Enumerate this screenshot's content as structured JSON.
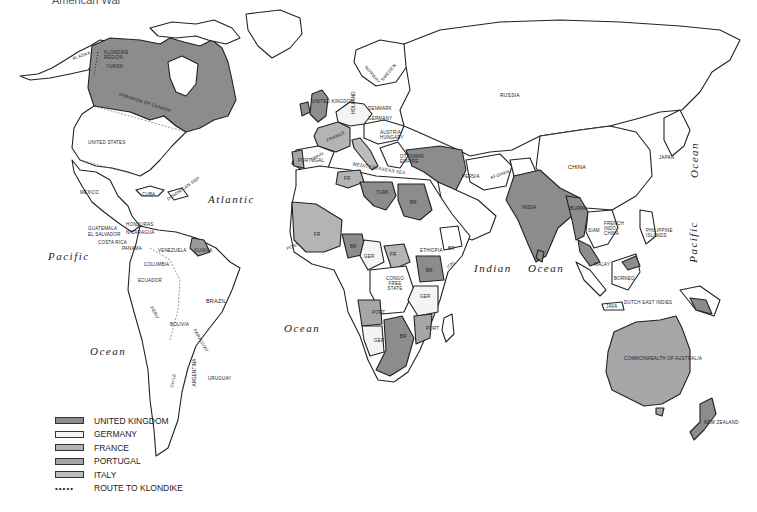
{
  "title": "American War",
  "colors": {
    "united_kingdom": "#8c8c8c",
    "germany": "#f4f4f4",
    "france": "#b4b4b4",
    "portugal": "#a6a6a6",
    "italy": "#bdbdbd",
    "land": "#ffffff",
    "outline": "#222222"
  },
  "legend": {
    "items": [
      {
        "label": "UNITED KINGDOM",
        "color": "#8c8c8c"
      },
      {
        "label": "GERMANY",
        "color": "#f4f4f4"
      },
      {
        "label": "FRANCE",
        "color": "#b4b4b4"
      },
      {
        "label": "PORTUGAL",
        "color": "#a6a6a6"
      },
      {
        "label": "ITALY",
        "color": "#bdbdbd"
      }
    ],
    "route": {
      "symbol": "•••••",
      "label": "ROUTE TO KLONDIKE"
    }
  },
  "oceans": {
    "atlantic": "Atlantic",
    "pacific_west": "Pacific",
    "ocean_sw": "Ocean",
    "ocean_s_atlantic": "Ocean",
    "indian": "Indian",
    "indian_ocean": "Ocean",
    "pacific_east": "Pacific",
    "ocean_ne": "Ocean"
  },
  "labels": {
    "alaska": "Alaska",
    "klondike": "Klondike Region",
    "yukon": "Yukon",
    "canada": "Dominion of Canada",
    "us": "United States",
    "mexico": "Mexico",
    "cuba": "Cuba",
    "dominican": "Dominican Rep",
    "haiti": "Haiti",
    "honduras": "Honduras",
    "guatemala": "Guatemala",
    "el_salvador": "El Salvador",
    "nicaragua": "Nicaragua",
    "costa_rica": "Costa Rica",
    "panama": "Panama",
    "venezuela": "Venezuela",
    "guiana": "Guiana",
    "colombia": "Columbia",
    "ecuador": "Ecuador",
    "brazil": "Brazil",
    "peru": "Peru",
    "bolivia": "Bolivia",
    "paraguay": "Paraguay",
    "chile": "Chile",
    "argentina": "Argentina",
    "uruguay": "Uruguay",
    "uk": "United Kingdom",
    "holland": "Holland",
    "norway": "Norway",
    "sweden": "Sweden",
    "denmark": "Denmark",
    "germany": "Germany",
    "france": "France",
    "austria": "Austria-Hungary",
    "spain": "Spain",
    "portugal": "Portugal",
    "italy": "Italy",
    "ottoman": "Ottoman Empire",
    "russia": "Russia",
    "persia": "Persia",
    "afghan": "Afghan",
    "china": "China",
    "japan": "Japan",
    "india": "India",
    "burma": "Burma",
    "siam": "Siam",
    "indochina": "French Indo-China",
    "philippines": "Philippine Islands",
    "malay": "Malay",
    "borneo": "Borneo",
    "dutch_east_indies": "Dutch East Indies",
    "java": "Java",
    "australia": "Commonwealth of Australia",
    "nz": "New Zealand",
    "mediterranean": "Mediterranean Sea",
    "fr_algeria": "FR",
    "turk": "Turk",
    "br_egypt": "BR",
    "fr_west": "FR",
    "port_guinea": "Port",
    "br_sl": "BR",
    "br_gc": "BR",
    "ger_togo": "GER",
    "br_nigeria": "BR",
    "ger_cameroon": "GER",
    "fr_eq": "FR",
    "ethiopia": "Ethiopia",
    "br_somali": "BR",
    "ital": "ITAL",
    "congo": "Congo Free State",
    "br_east": "BR",
    "ger_east": "GER",
    "port_angola": "PORT",
    "port_moz": "PORT",
    "ger_sw": "GER",
    "br_south": "BR"
  }
}
